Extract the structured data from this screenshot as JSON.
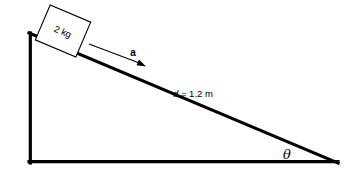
{
  "figure": {
    "background_color": "#ffffff",
    "stroke_color": "#000000",
    "block_fill": "#ffffff"
  },
  "labels": {
    "mass": "2 kg",
    "acceleration": "a",
    "distance_var": "d",
    "distance_eq": " = 1.2 m",
    "distance_full": "d = 1.2 m",
    "angle": "θ"
  },
  "geometry": {
    "incline": {
      "apex": {
        "x": 29,
        "y": 33
      },
      "bottom_left": {
        "x": 29,
        "y": 163
      },
      "bottom_right": {
        "x": 338,
        "y": 163
      },
      "hypotenuse_thickness": 3.2,
      "leg_thickness": 3.2
    },
    "block": {
      "center": {
        "x": 63,
        "y": 31
      },
      "width": 44,
      "height": 38,
      "rotation_deg": 23,
      "stroke_width": 1.1
    },
    "arrow": {
      "start": {
        "x": 89,
        "y": 44
      },
      "end": {
        "x": 146,
        "y": 66
      },
      "stroke_width": 1.1,
      "head_length": 8
    }
  },
  "values": {
    "mass_kg": 2,
    "distance_m": 1.2,
    "incline_angle_symbol": "theta"
  }
}
